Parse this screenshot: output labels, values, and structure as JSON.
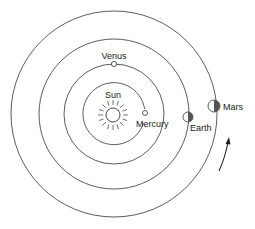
{
  "diagram": {
    "type": "solar-system-orbits",
    "center": {
      "x": 114,
      "y": 114
    },
    "sun": {
      "label": "Sun",
      "x": 113,
      "y": 115,
      "r": 7
    },
    "planets": [
      {
        "name": "Mercury",
        "label": "Mercury",
        "orbit_r": 31,
        "x": 145,
        "y": 113,
        "size": 2.5,
        "shaded": "none"
      },
      {
        "name": "Venus",
        "label": "Venus",
        "orbit_r": 50,
        "x": 114,
        "y": 64,
        "size": 2.6,
        "shaded": "none"
      },
      {
        "name": "Earth",
        "label": "Earth",
        "orbit_r": 75,
        "x": 188,
        "y": 117,
        "size": 5,
        "shaded": "right-half"
      },
      {
        "name": "Mars",
        "label": "Mars",
        "orbit_r": 103,
        "x": 214,
        "y": 106,
        "size": 6,
        "shaded": "right-half"
      }
    ],
    "arrow": {
      "direction": "counterclockwise",
      "description": "orbital motion arrow"
    },
    "colors": {
      "line": "#4a4a4a",
      "shade": "#555555",
      "background": "#ffffff"
    }
  }
}
